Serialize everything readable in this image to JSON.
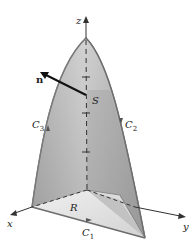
{
  "figure": {
    "labels": {
      "z_axis": "z",
      "x_axis": "x",
      "y_axis": "y",
      "normal": "n",
      "surface": "S",
      "region": "R",
      "curve1": "C",
      "curve1_sub": "1",
      "curve2": "C",
      "curve2_sub": "2",
      "curve3": "C",
      "curve3_sub": "3"
    },
    "colors": {
      "surface_light": "#dcdcdc",
      "surface_dark": "#9a9a9a",
      "region_fill": "#e6e6e6",
      "edge": "#7a7a7a",
      "axis": "#333333"
    }
  }
}
